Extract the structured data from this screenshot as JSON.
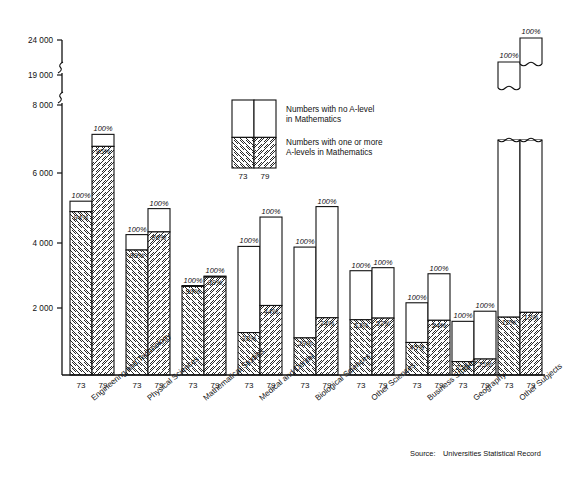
{
  "chart_data": {
    "type": "bar",
    "title": "",
    "subtitle": "",
    "xlabel": "",
    "ylabel": "",
    "ylim": [
      0,
      24000
    ],
    "grid": false,
    "axis_breaks": [
      8000,
      19000
    ],
    "ytick_labels": [
      "24 000",
      "19 000",
      "8 000",
      "6 000",
      "4 000",
      "2 000"
    ],
    "ytick_values": [
      24000,
      19000,
      8000,
      6000,
      4000,
      2000
    ],
    "categories": [
      "Engineering and Technology",
      "Physical Sciences",
      "Mathematical Studies",
      "Medical and Dental",
      "Biological Sciences",
      "Other Sciences",
      "Business Studies",
      "Geography",
      "Other Subjects"
    ],
    "year_labels": [
      "73",
      "79"
    ],
    "series": [
      {
        "name": "Numbers with one or more A-levels in Mathematics",
        "hatched": true
      },
      {
        "name": "Numbers with no A-level in Mathematics",
        "hatched": false
      }
    ],
    "bars": [
      {
        "category": "Engineering and Technology",
        "year": "73",
        "total": 5150,
        "hatched_pct": 94,
        "total_pct": 100,
        "total_label": "100%",
        "hatched_label": "94%",
        "truncated": false
      },
      {
        "category": "Engineering and Technology",
        "year": "79",
        "total": 7130,
        "hatched_pct": 95,
        "total_pct": 100,
        "total_label": "100%",
        "hatched_label": "95%",
        "truncated": false
      },
      {
        "category": "Physical Sciences",
        "year": "73",
        "total": 4160,
        "hatched_pct": 89,
        "total_pct": 100,
        "total_label": "100%",
        "hatched_label": "89%",
        "truncated": false
      },
      {
        "category": "Physical Sciences",
        "year": "79",
        "total": 4930,
        "hatched_pct": 86,
        "total_pct": 100,
        "total_label": "100%",
        "hatched_label": "86%",
        "truncated": false
      },
      {
        "category": "Mathematical Studies",
        "year": "73",
        "total": 2650,
        "hatched_pct": 99,
        "total_pct": 100,
        "total_label": "100%",
        "hatched_label": "99%",
        "truncated": false
      },
      {
        "category": "Mathematical Studies",
        "year": "79",
        "total": 2930,
        "hatched_pct": 99,
        "total_pct": 100,
        "total_label": "100%",
        "hatched_label": "99%",
        "truncated": false
      },
      {
        "category": "Medical and Dental",
        "year": "73",
        "total": 3810,
        "hatched_pct": 33,
        "total_pct": 100,
        "total_label": "100%",
        "hatched_label": "33%",
        "truncated": false
      },
      {
        "category": "Medical and Dental",
        "year": "79",
        "total": 4680,
        "hatched_pct": 44,
        "total_pct": 100,
        "total_label": "100%",
        "hatched_label": "44%",
        "truncated": false
      },
      {
        "category": "Biological Sciences",
        "year": "73",
        "total": 3790,
        "hatched_pct": 29,
        "total_pct": 100,
        "total_label": "100%",
        "hatched_label": "29%",
        "truncated": false
      },
      {
        "category": "Biological Sciences",
        "year": "79",
        "total": 4990,
        "hatched_pct": 34,
        "total_pct": 100,
        "total_label": "100%",
        "hatched_label": "34%",
        "truncated": false
      },
      {
        "category": "Other Sciences",
        "year": "73",
        "total": 3090,
        "hatched_pct": 53,
        "total_pct": 100,
        "total_label": "100%",
        "hatched_label": "53%",
        "truncated": false
      },
      {
        "category": "Other Sciences",
        "year": "79",
        "total": 3180,
        "hatched_pct": 53,
        "total_pct": 100,
        "total_label": "100%",
        "hatched_label": "53%",
        "truncated": false
      },
      {
        "category": "Business Studies",
        "year": "73",
        "total": 2140,
        "hatched_pct": 45,
        "total_pct": 100,
        "total_label": "100%",
        "hatched_label": "45%",
        "truncated": false
      },
      {
        "category": "Business Studies",
        "year": "79",
        "total": 3000,
        "hatched_pct": 54,
        "total_pct": 100,
        "total_label": "100%",
        "hatched_label": "54%",
        "truncated": false
      },
      {
        "category": "Geography",
        "year": "73",
        "total": 1590,
        "hatched_pct": 25,
        "total_pct": 100,
        "total_label": "100%",
        "hatched_label": "25%",
        "truncated": false
      },
      {
        "category": "Geography",
        "year": "79",
        "total": 1890,
        "hatched_pct": 25,
        "total_pct": 100,
        "total_label": "100%",
        "hatched_label": "25%",
        "truncated": false
      },
      {
        "category": "Other Subjects",
        "year": "73",
        "total": 19500,
        "hatched_pct": 12,
        "total_pct": 100,
        "total_label": "100%",
        "hatched_label": "12%",
        "truncated": true
      },
      {
        "category": "Other Subjects",
        "year": "79",
        "total": 23600,
        "hatched_pct": 13,
        "total_pct": 100,
        "total_label": "100%",
        "hatched_label": "13%",
        "truncated": true
      }
    ]
  },
  "legend": {
    "year_labels": [
      "73",
      "79"
    ],
    "entries": [
      {
        "key": "no-alevel",
        "line1": "Numbers with no A-level",
        "line2": "in Mathematics",
        "hatched": false
      },
      {
        "key": "one-or-more-alevel",
        "line1": "Numbers with one or more",
        "line2": "A-levels in Mathematics",
        "hatched": true
      }
    ]
  },
  "source": {
    "label": "Source:",
    "value": "Universities Statistical Record"
  },
  "colors": {
    "ink": "#111111",
    "paper": "#ffffff",
    "hatch": "#111111"
  }
}
